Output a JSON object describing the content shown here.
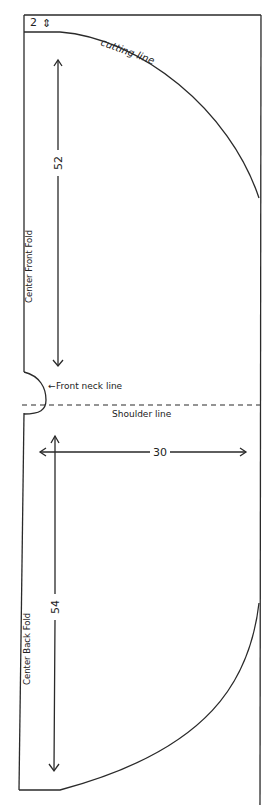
{
  "diagram": {
    "type": "sewing-pattern",
    "colors": {
      "line": "#2a2a2a",
      "background": "#ffffff"
    },
    "labels": {
      "top_margin": "2",
      "top_margin_icon": "⇕",
      "cutting_line": "cutting line",
      "front_measure": "52",
      "center_front_fold": "Center Front Fold",
      "front_neck_line": "Front neck line",
      "front_neck_arrow": "←",
      "shoulder_line": "Shoulder line",
      "width_measure": "30",
      "back_measure": "54",
      "center_back_fold": "Center Back Fold"
    }
  }
}
